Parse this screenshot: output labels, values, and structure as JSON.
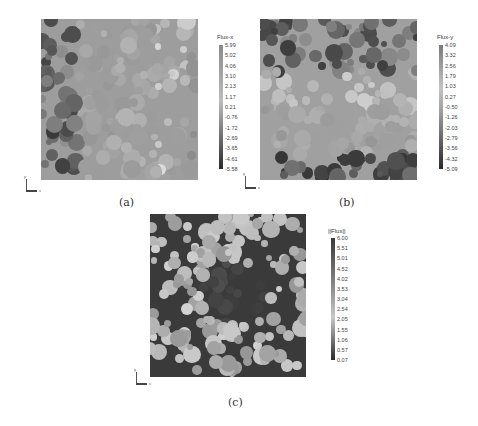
{
  "figure": {
    "panels": [
      {
        "id": "a",
        "caption": "(a)",
        "field": "Flux-x",
        "colorbar": {
          "title": "Flux-x",
          "ticks": [
            "5.99",
            "5.02",
            "4.06",
            "3.10",
            "2.13",
            "1.17",
            "0.21",
            "-0.76",
            "-1.72",
            "-2.69",
            "-3.65",
            "-4.61",
            "-5.58"
          ]
        },
        "axes": {
          "y": "y",
          "x": "x"
        }
      },
      {
        "id": "b",
        "caption": "(b)",
        "field": "Flux-y",
        "colorbar": {
          "title": "Flux-y",
          "ticks": [
            "4.09",
            "3.32",
            "2.56",
            "1.79",
            "1.03",
            "0.27",
            "-0.50",
            "-1.26",
            "-2.03",
            "-2.79",
            "-3.56",
            "-4.32",
            "-5.09"
          ]
        },
        "axes": {
          "y": "y",
          "x": "x"
        }
      },
      {
        "id": "c",
        "caption": "(c)",
        "field": "||Flux||",
        "colorbar": {
          "title": "||Flux||",
          "ticks": [
            "6.00",
            "5.51",
            "5.01",
            "4.52",
            "4.02",
            "3.53",
            "3.04",
            "2.54",
            "2.05",
            "1.55",
            "1.06",
            "0.57",
            "0.07"
          ]
        },
        "axes": {
          "y": "y",
          "x": "x"
        }
      }
    ],
    "colors": {
      "background_mid": "#9a9a9a",
      "dark": "#2e2e2e",
      "light": "#d2d2d2"
    }
  }
}
